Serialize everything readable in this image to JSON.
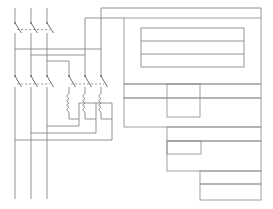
{
  "document": {
    "title": "Motor Starter Control Schematic",
    "type": "electrical-schematic",
    "canvas": {
      "width": 273,
      "height": 209,
      "background": "#ffffff"
    },
    "stroke_color": "#7d7f84",
    "stroke_color_dark": "#5e6066",
    "box_color": "#8d8f94"
  },
  "diagram": {
    "supply_lines": {
      "name": "three-phase-supply",
      "count": 3,
      "x_positions": [
        15,
        31,
        47
      ],
      "y_top": 8,
      "y_bottom": 199
    },
    "disconnect": {
      "name": "three-pole-disconnect-switch",
      "label": "",
      "y_pivot": 23,
      "y_contact": 31,
      "poles": [
        {
          "x": 15
        },
        {
          "x": 31
        },
        {
          "x": 47
        }
      ],
      "mech_link": {
        "y": 29,
        "x1": 15,
        "x2": 47,
        "style": "dashed"
      }
    },
    "contactor_left": {
      "name": "three-pole-contactor-main",
      "y_pivot": 76,
      "y_contact": 86,
      "poles": [
        {
          "x": 15
        },
        {
          "x": 31
        },
        {
          "x": 47
        }
      ],
      "mech_link": {
        "y": 84,
        "x1": 15,
        "x2": 47,
        "style": "dashed"
      }
    },
    "contactor_right": {
      "name": "three-pole-contactor-star",
      "y_pivot": 76,
      "y_contact": 86,
      "poles": [
        {
          "x": 69
        },
        {
          "x": 85
        },
        {
          "x": 101
        }
      ],
      "mech_link": {
        "y": 84,
        "x1": 69,
        "x2": 101,
        "style": "dashed"
      }
    },
    "overload_relay": {
      "name": "thermal-overload-relay",
      "elements": 3,
      "x_positions": [
        69,
        85,
        101
      ],
      "y_top": 94,
      "y_bottom": 112,
      "loops": 4
    },
    "bus_bars": [
      {
        "name": "bus-phase-1",
        "y": 49,
        "x1": 15,
        "x2": 101
      },
      {
        "name": "bus-phase-2",
        "y": 55,
        "x1": 31,
        "x2": 85
      },
      {
        "name": "bus-phase-3",
        "y": 61,
        "x1": 47,
        "x2": 69
      }
    ],
    "return_wires": [
      {
        "name": "return-wire-1",
        "y": 126,
        "x1": 47,
        "x2": 79
      },
      {
        "name": "return-wire-2",
        "y": 133,
        "x1": 31,
        "x2": 96
      },
      {
        "name": "return-wire-3",
        "y": 140,
        "x1": 15,
        "x2": 112
      }
    ],
    "feed_lines": [
      {
        "name": "feed-line-outer",
        "x": 101,
        "y_top": 8
      },
      {
        "name": "feed-line-inner",
        "x": 85,
        "y_top": 18
      }
    ]
  },
  "panel": {
    "name": "right-panel-assembly",
    "outer": {
      "x": 124,
      "y": 18,
      "w": 137,
      "h": 109
    },
    "inner_table": {
      "name": "inner-row-table",
      "x": 141,
      "y": 28,
      "w": 103,
      "h": 39,
      "rows": 3,
      "row_labels": [
        "",
        "",
        ""
      ]
    },
    "mid_rows": [
      {
        "name": "panel-row-1",
        "x": 124,
        "y": 84,
        "w": 137,
        "h": 14
      },
      {
        "name": "panel-row-2",
        "x": 124,
        "y": 98,
        "w": 137,
        "h": 29
      }
    ],
    "mid_inset": {
      "name": "panel-inset-1",
      "x": 167,
      "y": 84,
      "w": 33,
      "h": 33
    },
    "cascade": {
      "name": "cascade-step-blocks",
      "steps": [
        {
          "name": "cascade-step-1",
          "x": 167,
          "y": 127,
          "w": 94,
          "h": 14
        },
        {
          "name": "cascade-step-2",
          "x": 167,
          "y": 141,
          "w": 94,
          "h": 30
        },
        {
          "name": "cascade-step-3",
          "x": 200,
          "y": 171,
          "w": 61,
          "h": 13
        },
        {
          "name": "cascade-step-4",
          "x": 200,
          "y": 184,
          "w": 61,
          "h": 16
        }
      ],
      "insets": [
        {
          "name": "cascade-inset-1",
          "x": 167,
          "y": 141,
          "w": 34,
          "h": 13
        }
      ]
    }
  },
  "legend": {
    "components": [
      {
        "key": "disconnect",
        "label": ""
      },
      {
        "key": "contactor",
        "label": ""
      },
      {
        "key": "overload",
        "label": ""
      }
    ]
  }
}
